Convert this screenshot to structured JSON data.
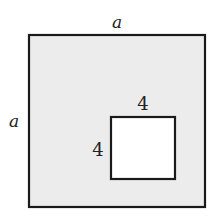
{
  "diagram": {
    "outer_square": {
      "side_label_top": "a",
      "side_label_left": "a",
      "fill": "#ececec",
      "stroke": "#1a1a1a"
    },
    "inner_square": {
      "side_label_top": "4",
      "side_label_left": "4",
      "fill": "#ffffff",
      "stroke": "#1a1a1a"
    }
  }
}
